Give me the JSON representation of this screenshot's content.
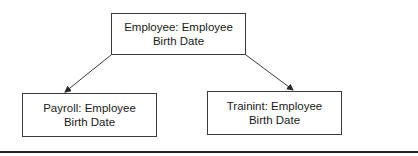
{
  "diagram": {
    "type": "hierarchy",
    "nodes": [
      {
        "id": "employee",
        "line1": "Employee: Employee",
        "line2": "Birth Date"
      },
      {
        "id": "payroll",
        "line1": "Payroll: Employee",
        "line2": "Birth Date"
      },
      {
        "id": "training",
        "line1": "Trainint: Employee",
        "line2": "Birth Date"
      }
    ],
    "edges": [
      {
        "from": "employee",
        "to": "payroll"
      },
      {
        "from": "employee",
        "to": "training"
      }
    ]
  },
  "colors": {
    "line": "#3a3a3a",
    "rule": "#222222",
    "background": "#ffffff",
    "text": "#1a1a1a"
  }
}
